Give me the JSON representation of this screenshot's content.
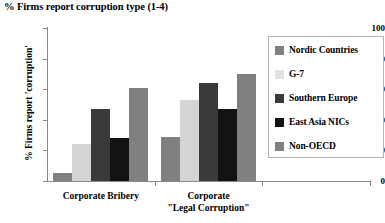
{
  "chart_data": {
    "type": "bar",
    "title": "% Firms report corruption type (1-4)",
    "xlabel": "",
    "ylabel": "% Firms report 'corruption'",
    "ylim": [
      0,
      100
    ],
    "yticks": [
      0,
      20,
      40,
      60,
      80,
      100
    ],
    "grid": false,
    "legend_position": "right",
    "categories": [
      "Corporate Bribery",
      "Corporate \"Legal Corruption\""
    ],
    "category_lines": [
      [
        "Corporate Bribery"
      ],
      [
        "Corporate",
        "\"Legal Corruption\""
      ]
    ],
    "series": [
      {
        "name": "Nordic Countries",
        "color": "#808080",
        "values": [
          5,
          29
        ]
      },
      {
        "name": "G-7",
        "color": "#d4d4d4",
        "values": [
          24,
          53
        ]
      },
      {
        "name": "Southern Europe",
        "color": "#3a3a3a",
        "values": [
          47,
          64
        ]
      },
      {
        "name": "East Asia NICs",
        "color": "#131313",
        "values": [
          28,
          47
        ]
      },
      {
        "name": "Non-OECD",
        "color": "#808080",
        "values": [
          61,
          70
        ]
      }
    ]
  },
  "legend": {
    "items": [
      {
        "label": "Nordic Countries",
        "color": "#808080"
      },
      {
        "label": "G-7",
        "color": "#e2e2e2"
      },
      {
        "label": "Southern Europe",
        "color": "#3a3a3a"
      },
      {
        "label": "East Asia NICs",
        "color": "#131313"
      },
      {
        "label": "Non-OECD",
        "color": "#808080"
      }
    ]
  }
}
